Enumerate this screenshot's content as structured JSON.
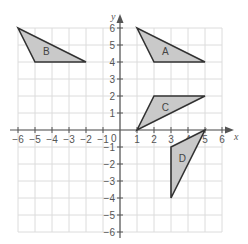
{
  "diagram": {
    "type": "coordinate-grid",
    "x_axis": {
      "label": "x",
      "min": -6,
      "max": 6,
      "ticks": [
        "−6",
        "−5",
        "−4",
        "−3",
        "−2",
        "−1",
        "1",
        "2",
        "3",
        "4",
        "5",
        "6"
      ]
    },
    "y_axis": {
      "label": "y",
      "min": -6,
      "max": 6,
      "ticks": [
        "6",
        "5",
        "4",
        "3",
        "2",
        "1",
        "−1",
        "−2",
        "−3",
        "−4",
        "−5",
        "−6"
      ]
    },
    "origin_label": "0",
    "colors": {
      "fill": "#c9c9c9",
      "stroke": "#333333",
      "grid": "#dcdcdc",
      "axis": "#555555"
    },
    "shapes": [
      {
        "label": "A",
        "vertices": [
          [
            1,
            6
          ],
          [
            2,
            4
          ],
          [
            5,
            4
          ]
        ]
      },
      {
        "label": "B",
        "vertices": [
          [
            -6,
            6
          ],
          [
            -5,
            4
          ],
          [
            -2,
            4
          ]
        ]
      },
      {
        "label": "C",
        "vertices": [
          [
            1,
            0
          ],
          [
            2,
            2
          ],
          [
            5,
            2
          ]
        ]
      },
      {
        "label": "D",
        "vertices": [
          [
            5,
            0
          ],
          [
            3,
            -1
          ],
          [
            3,
            -4
          ]
        ]
      }
    ]
  }
}
